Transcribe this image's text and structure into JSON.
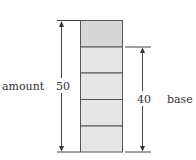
{
  "diagram": {
    "labels": {
      "amount": "amount",
      "amount_value": "50",
      "base": "base",
      "base_value": "40"
    },
    "colors": {
      "top_box": "#d7d7d7",
      "lower_boxes": "#e6e6e6",
      "stroke": "#555555"
    },
    "boxes": [
      {
        "index": 0,
        "shade": "dark"
      },
      {
        "index": 1,
        "shade": "light"
      },
      {
        "index": 2,
        "shade": "light"
      },
      {
        "index": 3,
        "shade": "light"
      },
      {
        "index": 4,
        "shade": "light"
      }
    ]
  }
}
